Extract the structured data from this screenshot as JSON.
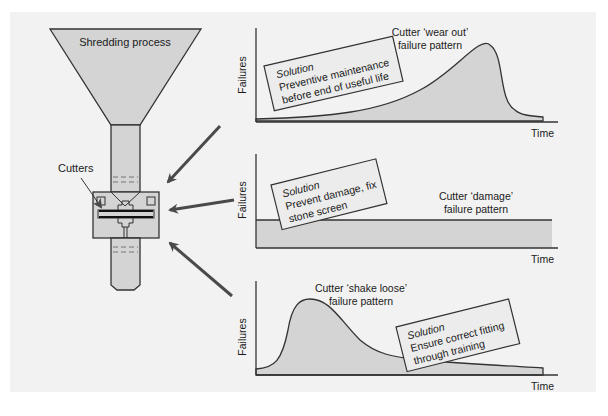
{
  "machine": {
    "funnel_label": "Shredding process",
    "cutters_label": "Cutters"
  },
  "colors": {
    "background": "#f2f2f2",
    "fill": "#d4d4d4",
    "line": "#333333",
    "arrow": "#4a4a4a",
    "note_fill": "#ececec"
  },
  "charts": [
    {
      "ylabel": "Failures",
      "xlabel": "Time",
      "pattern_line1": "Cutter ‘wear out’",
      "pattern_line2": "failure pattern",
      "note_title": "Solution",
      "note_line1": "Preventive maintenance",
      "note_line2": "before end of useful life"
    },
    {
      "ylabel": "Failures",
      "xlabel": "Time",
      "pattern_line1": "Cutter ‘damage’",
      "pattern_line2": "failure pattern",
      "note_title": "Solution",
      "note_line1": "Prevent damage, fix",
      "note_line2": "stone screen"
    },
    {
      "ylabel": "Failures",
      "xlabel": "Time",
      "pattern_line1": "Cutter ‘shake loose’",
      "pattern_line2": "failure pattern",
      "note_title": "Solution",
      "note_line1": "Ensure correct fitting",
      "note_line2": "through training"
    }
  ]
}
